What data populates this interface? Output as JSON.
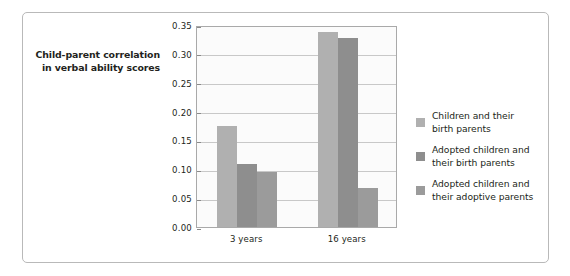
{
  "chart_data": {
    "type": "bar",
    "title": "",
    "subtitle": "",
    "xlabel": "",
    "ylabel": "Child-parent correlation\nin verbal ability scores",
    "categories": [
      "3 years",
      "16 years"
    ],
    "series": [
      {
        "name": "Children and their\nbirth parents",
        "color": "#b0b0b0",
        "values": [
          0.175,
          0.338
        ]
      },
      {
        "name": "Adopted children and\ntheir birth parents",
        "color": "#8e8e8e",
        "values": [
          0.11,
          0.328
        ]
      },
      {
        "name": "Adopted children and\ntheir adoptive parents",
        "color": "#9b9b9b",
        "values": [
          0.095,
          0.068
        ]
      }
    ],
    "ylim": [
      0.0,
      0.35
    ],
    "ytick_labels": [
      "0.00",
      "0.05",
      "0.10",
      "0.15",
      "0.20",
      "0.25",
      "0.30",
      "0.35"
    ],
    "ytick_values": [
      0.0,
      0.05,
      0.1,
      0.15,
      0.2,
      0.25,
      0.3,
      0.35
    ],
    "grid": true,
    "legend_position": "right",
    "plot_background": "#fbfbfb",
    "gridline_color": "#c8c8c8",
    "frame_color": "#b9b9b9",
    "text_color": "#231f20"
  }
}
